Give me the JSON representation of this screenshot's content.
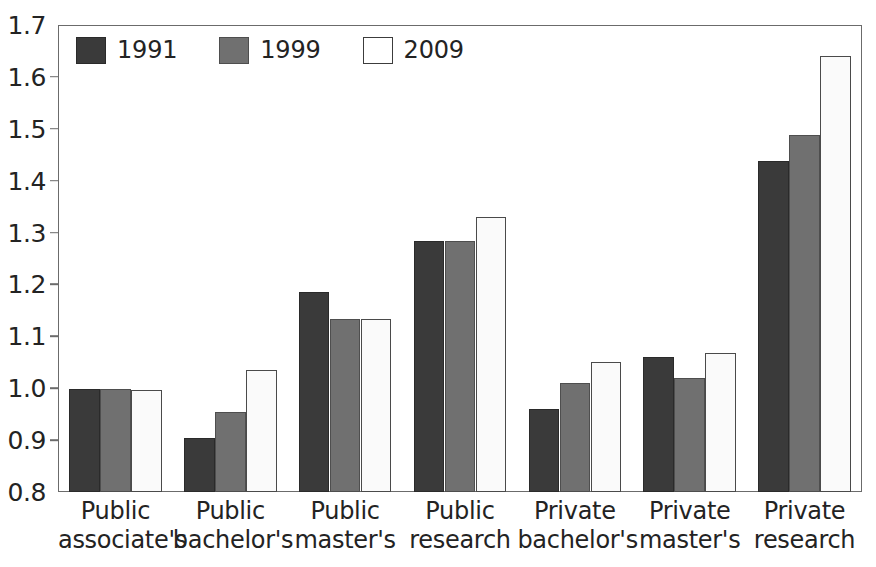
{
  "chart_data": {
    "type": "bar",
    "title": "",
    "xlabel": "",
    "ylabel": "",
    "ylim": [
      0.8,
      1.7
    ],
    "ytick_step": 0.1,
    "ytick_labels": [
      "1.7",
      "1.6",
      "1.5",
      "1.4",
      "1.3",
      "1.2",
      "1.1",
      "1.0",
      "0.9",
      "0.8"
    ],
    "ytick_values": [
      1.7,
      1.6,
      1.5,
      1.4,
      1.3,
      1.2,
      1.1,
      1.0,
      0.9,
      0.8
    ],
    "grid": false,
    "legend_position": "inside-top-left",
    "categories": [
      {
        "line1": "Public",
        "line2": "associate's"
      },
      {
        "line1": "Public",
        "line2": "bachelor's"
      },
      {
        "line1": "Public",
        "line2": "master's"
      },
      {
        "line1": "Public",
        "line2": "research"
      },
      {
        "line1": "Private",
        "line2": "bachelor's"
      },
      {
        "line1": "Private",
        "line2": "master's"
      },
      {
        "line1": "Private",
        "line2": "research"
      }
    ],
    "series": [
      {
        "name": "1991",
        "color": "#3a3a3a",
        "values": [
          0.998,
          0.905,
          1.185,
          1.283,
          0.96,
          1.06,
          1.438
        ]
      },
      {
        "name": "1999",
        "color": "#707070",
        "values": [
          0.998,
          0.955,
          1.133,
          1.283,
          1.01,
          1.02,
          1.488
        ]
      },
      {
        "name": "2009",
        "color": "#fafafa",
        "values": [
          0.997,
          1.035,
          1.133,
          1.33,
          1.05,
          1.068,
          1.64
        ]
      }
    ]
  },
  "legend": {
    "entries": [
      {
        "label": "1991",
        "swatch": "dark-gray-swatch"
      },
      {
        "label": "1999",
        "swatch": "medium-gray-swatch"
      },
      {
        "label": "2009",
        "swatch": "white-swatch"
      }
    ]
  },
  "title_sliver": {
    "text": ""
  }
}
